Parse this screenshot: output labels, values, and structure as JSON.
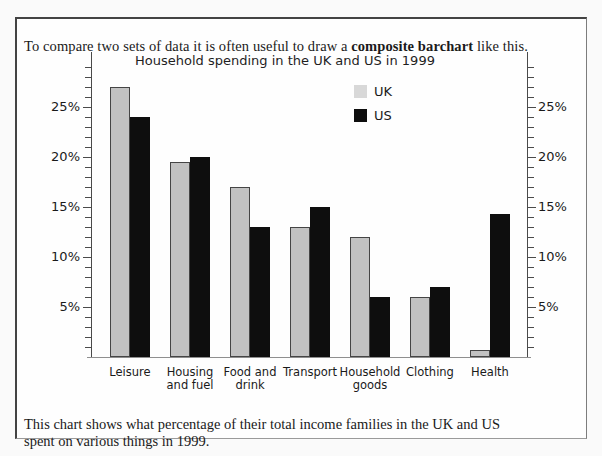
{
  "page": {
    "intro": {
      "prefix": "To compare two sets of data it is often useful to draw a ",
      "bold": "composite barchart",
      "suffix": " like this."
    },
    "caption": {
      "line1": "This chart shows what percentage of their total income families in the UK and US",
      "line2": "spent on various things in 1999."
    }
  },
  "chart_data": {
    "type": "bar",
    "title": "Household spending in the UK and US in 1999",
    "categories": [
      "Leisure",
      "Housing and fuel",
      "Food and drink",
      "Transport",
      "Household goods",
      "Clothing",
      "Health"
    ],
    "category_label_lines": [
      [
        "Leisure"
      ],
      [
        "Housing",
        "and fuel"
      ],
      [
        "Food and",
        "drink"
      ],
      [
        "Transport"
      ],
      [
        "Household",
        "goods"
      ],
      [
        "Clothing"
      ],
      [
        "Health"
      ]
    ],
    "series": [
      {
        "name": "UK",
        "bar_color": "#c2c2c2",
        "legend_swatch_color": "#d8d8d8",
        "values": [
          27,
          19.5,
          17,
          13,
          12,
          6,
          0.7
        ]
      },
      {
        "name": "US",
        "bar_color": "#0e0e0e",
        "legend_swatch_color": "#0e0e0e",
        "values": [
          24,
          20,
          13,
          15,
          6,
          7,
          14.3
        ]
      }
    ],
    "unit": "%",
    "ylabel": "",
    "xlabel": "",
    "y_axis": {
      "min": 0,
      "max": 30,
      "minor_tick_step": 1,
      "major_tick_step": 5,
      "labeled_ticks": [
        5,
        10,
        15,
        20,
        25
      ],
      "label_suffix": "%",
      "dual": true
    },
    "legend": {
      "position": "top-right-inside",
      "entries": [
        "UK",
        "US"
      ]
    },
    "grid": false,
    "bar_outline_color": "#454545",
    "axis_color": "#4a4a4a",
    "baseline_color": "#8f8f8f"
  }
}
